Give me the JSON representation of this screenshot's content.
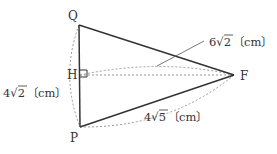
{
  "figure": {
    "type": "geometry-diagram",
    "points": {
      "Q": {
        "label": "Q",
        "x": 79,
        "y": 25
      },
      "H": {
        "label": "H",
        "x": 80,
        "y": 75
      },
      "P": {
        "label": "P",
        "x": 80,
        "y": 127
      },
      "F": {
        "label": "F",
        "x": 234,
        "y": 75
      }
    },
    "measurements": {
      "QP": {
        "coef": "4",
        "radicand": "2",
        "unit": "〔cm〕"
      },
      "QF": {
        "coef": "6",
        "radicand": "2",
        "unit": "〔cm〕"
      },
      "PF": {
        "coef": "4",
        "radicand": "5",
        "unit": "〔cm〕"
      }
    },
    "colors": {
      "solid": "#333333",
      "dashed": "#999999"
    }
  }
}
